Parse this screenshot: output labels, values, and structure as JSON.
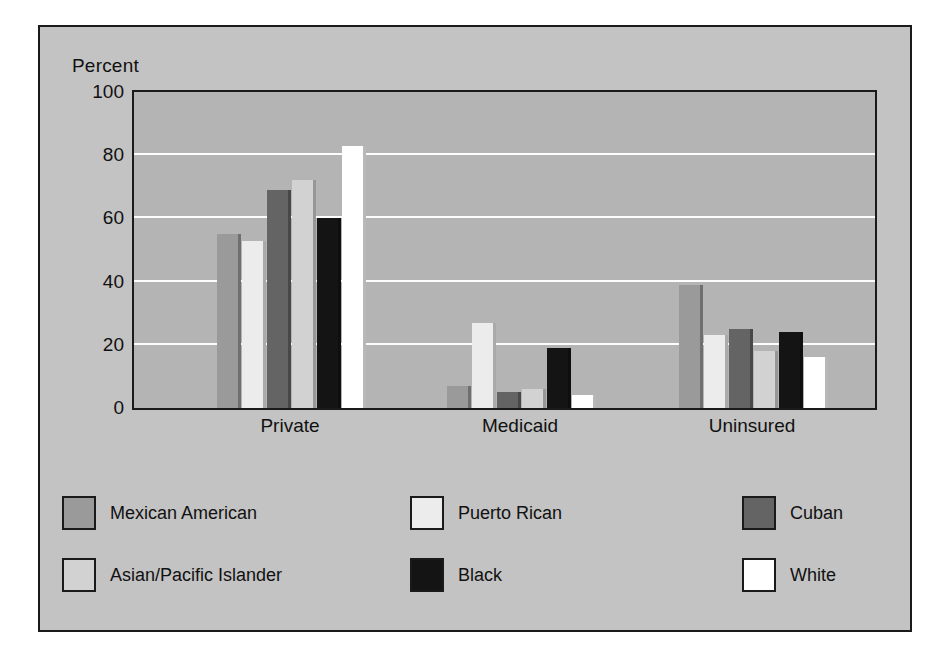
{
  "chart_data": {
    "type": "bar",
    "title": "",
    "ylabel": "Percent",
    "xlabel": "",
    "ylim": [
      0,
      100
    ],
    "yticks": [
      0,
      20,
      40,
      60,
      80,
      100
    ],
    "grid": true,
    "gridlines_at": [
      20,
      40,
      60,
      80
    ],
    "legend_position": "bottom",
    "categories": [
      "Private",
      "Medicaid",
      "Uninsured"
    ],
    "series": [
      {
        "name": "Mexican American",
        "color": "#9a9a9a",
        "values": [
          55,
          7,
          39
        ]
      },
      {
        "name": "Puerto Rican",
        "color": "#ececec",
        "values": [
          53,
          27,
          23
        ]
      },
      {
        "name": "Cuban",
        "color": "#646464",
        "values": [
          69,
          5,
          25
        ]
      },
      {
        "name": "Asian/Pacific Islander",
        "color": "#d2d2d2",
        "values": [
          72,
          6,
          18
        ]
      },
      {
        "name": "Black",
        "color": "#141414",
        "values": [
          60,
          19,
          24
        ]
      },
      {
        "name": "White",
        "color": "#ffffff",
        "values": [
          83,
          4,
          16
        ]
      }
    ]
  },
  "axes": {
    "y_axis_title": "Percent",
    "y_tick_labels": [
      "100",
      "80",
      "60",
      "40",
      "20",
      "0"
    ],
    "x_tick_labels": [
      "Private",
      "Medicaid",
      "Uninsured"
    ]
  },
  "legend": {
    "entries": [
      {
        "label": "Mexican American",
        "color": "#9a9a9a"
      },
      {
        "label": "Puerto Rican",
        "color": "#ececec"
      },
      {
        "label": "Cuban",
        "color": "#646464"
      },
      {
        "label": "Asian/Pacific Islander",
        "color": "#d2d2d2"
      },
      {
        "label": "Black",
        "color": "#141414"
      },
      {
        "label": "White",
        "color": "#ffffff"
      }
    ]
  },
  "colors": {
    "figure_background": "#c3c3c3",
    "plot_background": "#b4b4b4",
    "gridline": "#fdfdfd",
    "frame": "#1a1a1a",
    "text": "#111111"
  }
}
